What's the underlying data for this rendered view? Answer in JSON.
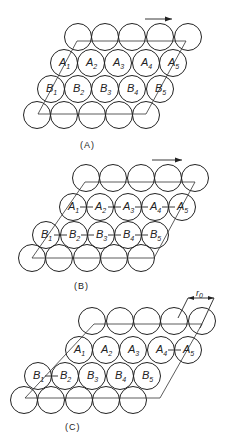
{
  "figure": {
    "panels": [
      {
        "id": "A",
        "caption": "(A)",
        "arrow": true,
        "rows": {
          "top": {
            "y": 37,
            "x": [
              78,
              105,
              132,
              160,
              188
            ]
          },
          "a": {
            "y": 63,
            "x": [
              64,
              91,
              118,
              146,
              173
            ],
            "labels": [
              "A",
              "A",
              "A",
              "A",
              "A"
            ],
            "subs": [
              "1",
              "2",
              "3",
              "4",
              "5"
            ]
          },
          "b": {
            "y": 89,
            "x": [
              51,
              78,
              105,
              132,
              160
            ],
            "labels": [
              "B",
              "B",
              "B",
              "B",
              "B"
            ],
            "subs": [
              "1",
              "2",
              "3",
              "4",
              "5"
            ]
          },
          "bottom": {
            "y": 115,
            "x": [
              37,
              64,
              92,
              119,
              146
            ]
          }
        },
        "ties": "none"
      },
      {
        "id": "B",
        "caption": "(B)",
        "arrow": true,
        "rows": {
          "top": {
            "y": 178,
            "x": [
              86,
              113,
              141,
              168,
              195
            ]
          },
          "a": {
            "y": 207,
            "x": [
              73,
              100,
              128,
              155,
              182
            ],
            "labels": [
              "A",
              "A",
              "A",
              "A",
              "A"
            ],
            "subs": [
              "1",
              "2",
              "3",
              "4",
              "5"
            ]
          },
          "b": {
            "y": 235,
            "x": [
              46,
              74,
              101,
              128,
              155
            ],
            "labels": [
              "B",
              "B",
              "B",
              "B",
              "B"
            ],
            "subs": [
              "1",
              "2",
              "3",
              "4",
              "5"
            ]
          },
          "bottom": {
            "y": 258,
            "x": [
              32,
              59,
              87,
              114,
              141
            ]
          }
        },
        "ties": "all"
      },
      {
        "id": "C",
        "caption": "(C)",
        "arrow": false,
        "dimension_label": "r",
        "dimension_sub": "0",
        "rows": {
          "top": {
            "y": 321,
            "x": [
              92,
              120,
              147,
              174,
              202
            ]
          },
          "a": {
            "y": 350,
            "x": [
              79,
              106,
              133,
              161,
              188
            ],
            "labels": [
              "A",
              "A",
              "A",
              "A",
              "A"
            ],
            "subs": [
              "1",
              "2",
              "3",
              "4",
              "5"
            ]
          },
          "b": {
            "y": 376,
            "x": [
              38,
              65,
              92,
              120,
              147
            ],
            "labels": [
              "B",
              "B",
              "B",
              "B",
              "B"
            ],
            "subs": [
              "1",
              "2",
              "3",
              "4",
              "5"
            ]
          },
          "bottom": {
            "y": 400,
            "x": [
              24,
              51,
              79,
              106,
              133
            ]
          }
        },
        "ties": "partial: A4-A5, B1-B2"
      }
    ],
    "circle_radius": 13.5
  }
}
